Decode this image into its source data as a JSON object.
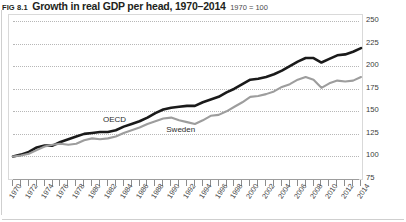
{
  "figure": {
    "number": "FIG 8.1",
    "title": "Growth in real GDP per head, 1970–2014",
    "subtitle": "1970 = 100"
  },
  "chart_data": {
    "type": "line",
    "title": "Growth in real GDP per head, 1970–2014",
    "subtitle": "1970 = 100",
    "xlabel": "",
    "ylabel": "",
    "ylim": [
      75,
      250
    ],
    "yticks": [
      75,
      100,
      125,
      150,
      175,
      200,
      225,
      250
    ],
    "xlim": [
      1970,
      2014
    ],
    "xticks": [
      1970,
      1972,
      1974,
      1976,
      1978,
      1980,
      1982,
      1984,
      1986,
      1988,
      1990,
      1992,
      1994,
      1996,
      1998,
      2000,
      2002,
      2004,
      2006,
      2008,
      2010,
      2012,
      2014
    ],
    "minor_xticks_every": 1,
    "grid": "horizontal-dotted",
    "legend": "inline-labels",
    "x": [
      1970,
      1971,
      1972,
      1973,
      1974,
      1975,
      1976,
      1977,
      1978,
      1979,
      1980,
      1981,
      1982,
      1983,
      1984,
      1985,
      1986,
      1987,
      1988,
      1989,
      1990,
      1991,
      1992,
      1993,
      1994,
      1995,
      1996,
      1997,
      1998,
      1999,
      2000,
      2001,
      2002,
      2003,
      2004,
      2005,
      2006,
      2007,
      2008,
      2009,
      2010,
      2011,
      2012,
      2013,
      2014
    ],
    "series": [
      {
        "name": "OECD",
        "color": "#1a1a1a",
        "values": [
          100,
          102,
          105,
          110,
          112,
          112,
          116,
          119,
          122,
          125,
          126,
          127,
          127,
          129,
          133,
          136,
          139,
          143,
          148,
          152,
          154,
          155,
          156,
          156,
          160,
          163,
          166,
          171,
          175,
          180,
          185,
          186,
          188,
          191,
          195,
          200,
          205,
          209,
          209,
          204,
          208,
          212,
          213,
          216,
          220
        ]
      },
      {
        "name": "Sweden",
        "color": "#9d9d9d",
        "values": [
          100,
          101,
          103,
          107,
          111,
          113,
          114,
          113,
          114,
          118,
          120,
          119,
          120,
          122,
          126,
          129,
          132,
          136,
          139,
          142,
          143,
          140,
          138,
          136,
          140,
          145,
          146,
          150,
          155,
          160,
          166,
          167,
          169,
          172,
          177,
          180,
          185,
          188,
          185,
          176,
          181,
          184,
          183,
          184,
          188
        ]
      }
    ],
    "annotations": [
      {
        "text": "OECD",
        "series": "OECD",
        "near_year": 1985
      },
      {
        "text": "Sweden",
        "series": "Sweden",
        "near_year": 1990
      }
    ]
  },
  "axis": {
    "y_tick_labels": [
      "250",
      "225",
      "200",
      "175",
      "150",
      "125",
      "100",
      "75"
    ],
    "x_tick_labels": [
      "1970",
      "1972",
      "1974",
      "1976",
      "1978",
      "1980",
      "1982",
      "1984",
      "1986",
      "1988",
      "1990",
      "1992",
      "1994",
      "1996",
      "1998",
      "2000",
      "2002",
      "2004",
      "2006",
      "2008",
      "2010",
      "2012",
      "2014"
    ]
  },
  "labels": {
    "oecd": "OECD",
    "sweden": "Sweden"
  }
}
